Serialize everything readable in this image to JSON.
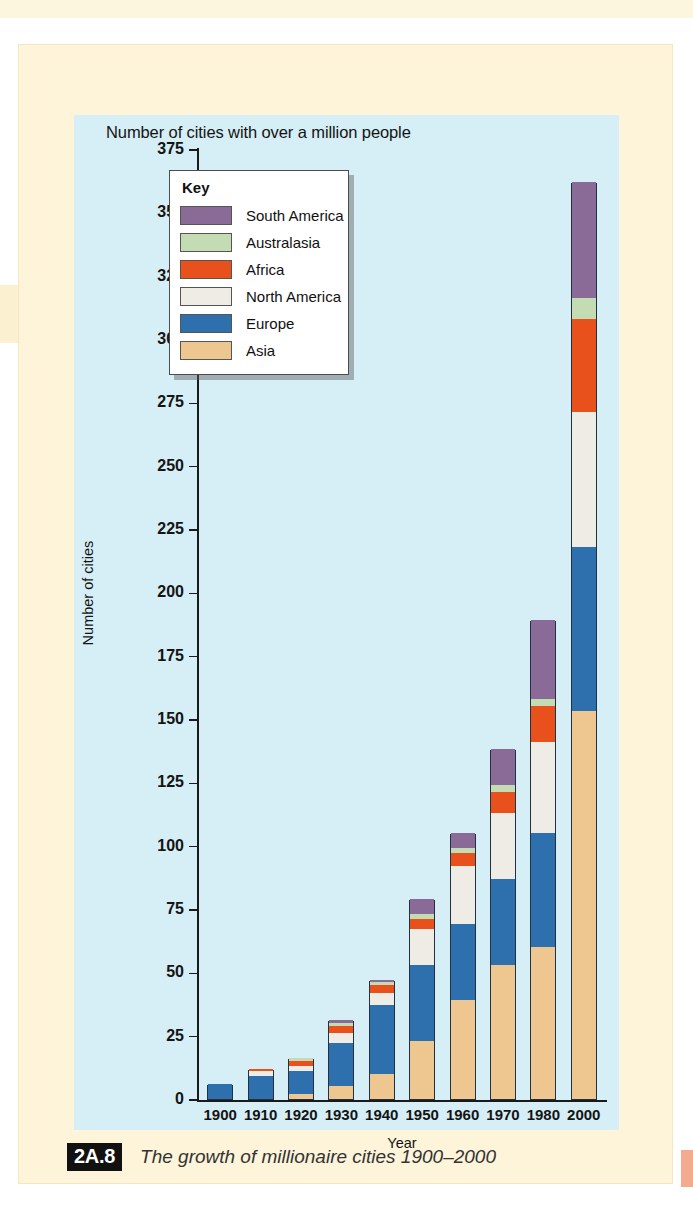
{
  "figure": {
    "tag": "2A.8",
    "caption": "The growth of millionaire cities 1900–2000"
  },
  "legend": {
    "title": "Key",
    "entries": [
      {
        "label": "South America",
        "color": "#8a6a96"
      },
      {
        "label": "Australasia",
        "color": "#c3dcb4"
      },
      {
        "label": "Africa",
        "color": "#e8511b"
      },
      {
        "label": "North America",
        "color": "#eeece4"
      },
      {
        "label": "Europe",
        "color": "#2e6fad"
      },
      {
        "label": "Asia",
        "color": "#edc690"
      }
    ]
  },
  "chart_data": {
    "type": "bar",
    "stacked": true,
    "title": "Number of cities with over a million people",
    "xlabel": "Year",
    "ylabel": "Number of cities",
    "ylim": [
      0,
      375
    ],
    "ytick_step": 25,
    "yticks": [
      0,
      25,
      50,
      75,
      100,
      125,
      150,
      175,
      200,
      225,
      250,
      275,
      300,
      325,
      350,
      375
    ],
    "grid": false,
    "legend_position": "inside-top-left",
    "categories": [
      "1900",
      "1910",
      "1920",
      "1930",
      "1940",
      "1950",
      "1960",
      "1970",
      "1980",
      "2000"
    ],
    "series": [
      {
        "name": "Asia",
        "color": "#edc690",
        "values": [
          0,
          0,
          2,
          5,
          10,
          23,
          39,
          53,
          60,
          153
        ]
      },
      {
        "name": "Europe",
        "color": "#2e6fad",
        "values": [
          6,
          9,
          9,
          17,
          27,
          30,
          30,
          34,
          45,
          65
        ]
      },
      {
        "name": "North America",
        "color": "#eeece4",
        "values": [
          0,
          2,
          2,
          4,
          5,
          14,
          23,
          26,
          36,
          53
        ]
      },
      {
        "name": "Africa",
        "color": "#e8511b",
        "values": [
          0,
          1,
          2,
          3,
          3,
          4,
          5,
          8,
          14,
          37
        ]
      },
      {
        "name": "Australasia",
        "color": "#c3dcb4",
        "values": [
          0,
          0,
          1,
          1,
          1,
          2,
          2,
          3,
          3,
          8
        ]
      },
      {
        "name": "South America",
        "color": "#8a6a96",
        "values": [
          0,
          0,
          0,
          1,
          1,
          6,
          6,
          14,
          31,
          46
        ]
      }
    ],
    "totals": [
      6,
      12,
      16,
      31,
      47,
      79,
      105,
      138,
      189,
      362
    ]
  }
}
